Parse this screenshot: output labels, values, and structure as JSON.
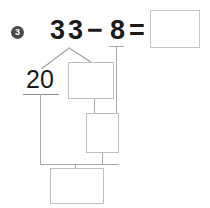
{
  "worksheet": {
    "problem_number": "3",
    "problem_number_icon": "circled-number-badge",
    "equation": {
      "minuend_digit_1": "3",
      "minuend_digit_2": "3",
      "minus_sign": "−",
      "subtrahend": "8",
      "equals_sign": "=",
      "answer_value": "",
      "answer_placeholder": ""
    },
    "decomposition": {
      "tens_label": "20",
      "box_top_value": "",
      "box_middle_value": "",
      "box_bottom_value": ""
    },
    "colors": {
      "text": "#1a1a1a",
      "badge_fill": "#4a4a4a",
      "badge_text": "#ffffff",
      "box_border": "#bfbfbf",
      "answer_box_border": "#c6c6c6",
      "connector_line": "#a8a8a8",
      "branch_line": "#8c8c8c",
      "background": "#ffffff"
    }
  }
}
